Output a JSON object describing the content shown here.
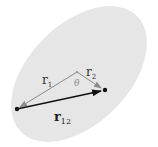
{
  "diagram": {
    "type": "vector-diagram",
    "region": {
      "shape": "ellipse",
      "fill": "#e6e6e6",
      "cx": 79,
      "cy": 74,
      "rx": 82,
      "ry": 50,
      "rotation_deg": -45
    },
    "points": {
      "origin": {
        "x": 77,
        "y": 72
      },
      "p1": {
        "x": 17,
        "y": 109
      },
      "p2": {
        "x": 105,
        "y": 90
      }
    },
    "vectors": [
      {
        "name": "r1",
        "from": "origin",
        "to": "p1",
        "color": "#8a8a8a"
      },
      {
        "name": "r2",
        "from": "origin",
        "to": "p2",
        "color": "#8a8a8a"
      },
      {
        "name": "r12",
        "from": "p1",
        "to": "p2",
        "color": "#111111"
      }
    ],
    "labels": {
      "r1": {
        "base": "r",
        "sub": "1"
      },
      "r2": {
        "base": "r",
        "sub": "2"
      },
      "r12": {
        "base": "r",
        "sub": "12"
      },
      "theta": "θ"
    },
    "colors": {
      "secondary_vector": "#8a8a8a",
      "primary_vector": "#111111",
      "label": "#333333",
      "theta": "#888888"
    }
  }
}
